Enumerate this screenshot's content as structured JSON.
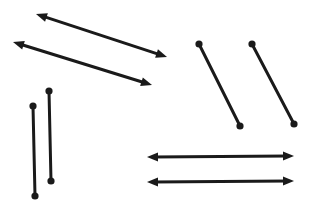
{
  "figure": {
    "width": 323,
    "height": 209,
    "background_color": "#ffffff",
    "stroke_color": "#1a1a1a",
    "stroke_width": 3,
    "dot_radius": 3.6,
    "arrow_head_length": 11,
    "arrow_head_width": 9,
    "shapes": [
      {
        "name": "double-arrow-diagonal-upper",
        "kind": "double-arrow",
        "x1": 36,
        "y1": 14,
        "x2": 167,
        "y2": 57,
        "orientation": "diagonal",
        "length_px": 138
      },
      {
        "name": "double-arrow-diagonal-lower",
        "kind": "double-arrow",
        "x1": 13,
        "y1": 42,
        "x2": 152,
        "y2": 85,
        "orientation": "diagonal",
        "length_px": 146
      },
      {
        "name": "dumbbell-diagonal-left",
        "kind": "dumbbell",
        "x1": 199,
        "y1": 44,
        "x2": 240,
        "y2": 126,
        "orientation": "diagonal",
        "length_px": 92
      },
      {
        "name": "dumbbell-diagonal-right",
        "kind": "dumbbell",
        "x1": 252,
        "y1": 44,
        "x2": 294,
        "y2": 124,
        "orientation": "diagonal",
        "length_px": 90
      },
      {
        "name": "dumbbell-vertical-left",
        "kind": "dumbbell",
        "x1": 33,
        "y1": 106,
        "x2": 35,
        "y2": 196,
        "orientation": "vertical",
        "length_px": 90
      },
      {
        "name": "dumbbell-vertical-right",
        "kind": "dumbbell",
        "x1": 49,
        "y1": 91,
        "x2": 51,
        "y2": 181,
        "orientation": "vertical",
        "length_px": 90
      },
      {
        "name": "double-arrow-horizontal-upper",
        "kind": "double-arrow",
        "x1": 147,
        "y1": 157,
        "x2": 294,
        "y2": 156,
        "orientation": "horizontal",
        "length_px": 147
      },
      {
        "name": "double-arrow-horizontal-lower",
        "kind": "double-arrow",
        "x1": 147,
        "y1": 182,
        "x2": 294,
        "y2": 181,
        "orientation": "horizontal",
        "length_px": 147
      }
    ]
  }
}
